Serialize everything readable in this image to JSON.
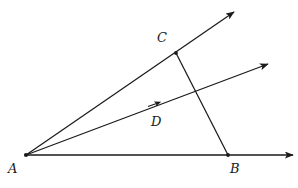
{
  "figure": {
    "background_color": "#ffffff",
    "stroke_color": "#1a1a1a",
    "label_color": "#1a1a1a",
    "width": 298,
    "height": 188,
    "points": [
      {
        "id": "A",
        "label": "A",
        "x": 26,
        "y": 155,
        "label_x": 8,
        "label_y": 162,
        "marked": true
      },
      {
        "id": "B",
        "label": "B",
        "x": 228,
        "y": 155,
        "label_x": 230,
        "label_y": 162,
        "marked": true
      },
      {
        "id": "C",
        "label": "C",
        "x": 176,
        "y": 53,
        "label_x": 157,
        "label_y": 31,
        "marked": true
      },
      {
        "id": "D",
        "label": "D",
        "x": 155,
        "y": 104,
        "label_x": 151,
        "label_y": 115,
        "marked": false
      }
    ],
    "rays": [
      {
        "id": "ray-upper",
        "name": "ray-AC-upper",
        "from": "A",
        "x1": 26,
        "y1": 155,
        "x2": 234,
        "y2": 12,
        "arrowhead": true,
        "tick_marker": null
      },
      {
        "id": "ray-middle",
        "name": "ray-AD-middle",
        "from": "A",
        "x1": 26,
        "y1": 155,
        "x2": 268,
        "y2": 64,
        "arrowhead": true,
        "tick_marker": {
          "x": 155,
          "y": 104
        }
      },
      {
        "id": "ray-base",
        "name": "ray-AB-horizontal",
        "from": "A",
        "x1": 26,
        "y1": 155,
        "x2": 293,
        "y2": 155,
        "arrowhead": true,
        "tick_marker": null
      }
    ],
    "segments": [
      {
        "id": "segment-CB",
        "name": "segment-C-to-B",
        "x1": 176,
        "y1": 53,
        "x2": 228,
        "y2": 155,
        "arrowhead": false
      }
    ],
    "intersections": [
      {
        "id": "int-CB-middle",
        "x": 195,
        "y": 92
      }
    ]
  }
}
